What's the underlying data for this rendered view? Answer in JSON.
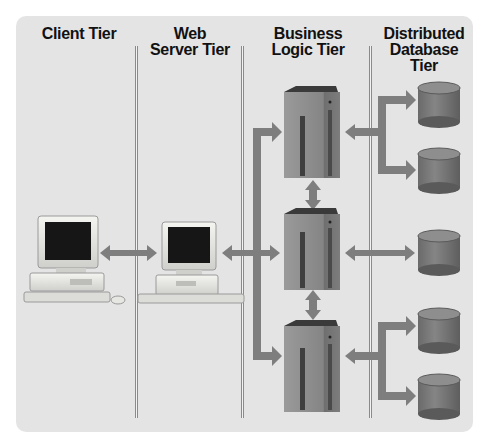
{
  "tiers": [
    {
      "label": "Client Tier"
    },
    {
      "label": "Web\nServer Tier"
    },
    {
      "label": "Business\nLogic Tier"
    },
    {
      "label": "Distributed\nDatabase\nTier"
    }
  ],
  "nodes": {
    "client": {
      "type": "desktop-pc",
      "count": 1
    },
    "web_server": {
      "type": "desktop-pc",
      "count": 1
    },
    "business_servers": {
      "type": "tower-server",
      "count": 3
    },
    "databases": {
      "type": "database-cylinder",
      "count": 5
    }
  },
  "colors": {
    "panel_bg": "#e4e4e4",
    "arrow": "#7e7e7e",
    "server": "#8c8c8c",
    "database": "#7a7a7a",
    "text": "#111111"
  }
}
